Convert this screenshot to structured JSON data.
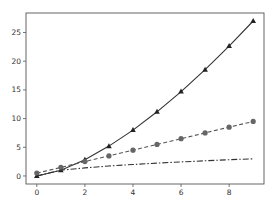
{
  "chart_data": {
    "type": "line",
    "title": "",
    "xlabel": "",
    "ylabel": "",
    "xlim": [
      -0.45,
      9.45
    ],
    "ylim": [
      -1.4,
      28.4
    ],
    "grid": false,
    "legend": null,
    "x_ticks": [
      0,
      2,
      4,
      6,
      8
    ],
    "y_ticks": [
      0,
      5,
      10,
      15,
      20,
      25
    ],
    "x": [
      0,
      1,
      2,
      3,
      4,
      5,
      6,
      7,
      8,
      9
    ],
    "series": [
      {
        "name": "x^1.5",
        "style": "solid",
        "marker": "triangle",
        "color": "#333333",
        "values": [
          0,
          1,
          2.83,
          5.2,
          8,
          11.18,
          14.7,
          18.52,
          22.63,
          27
        ]
      },
      {
        "name": "x+0.5",
        "style": "dashed",
        "marker": "circle",
        "color": "#555555",
        "values": [
          0.5,
          1.5,
          2.5,
          3.5,
          4.5,
          5.5,
          6.5,
          7.5,
          8.5,
          9.5
        ]
      },
      {
        "name": "sqrt(x)",
        "style": "dashdot",
        "marker": "none",
        "color": "#333333",
        "values": [
          0,
          1,
          1.41,
          1.73,
          2,
          2.24,
          2.45,
          2.65,
          2.83,
          3
        ]
      }
    ]
  }
}
